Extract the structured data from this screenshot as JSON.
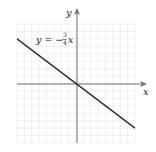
{
  "chart_data": {
    "type": "line",
    "title": "",
    "xlabel": "x",
    "ylabel": "y",
    "equation_label": "y = −¾x",
    "equation": {
      "slope": -0.75,
      "intercept": 0
    },
    "series": [
      {
        "name": "y = -3/4 x",
        "x": [
          -8,
          8
        ],
        "y": [
          6,
          -6
        ]
      }
    ],
    "xlim": [
      -8,
      8
    ],
    "ylim": [
      -8,
      8
    ],
    "grid": true,
    "legend": "none",
    "colors": {
      "line": "#2b2b2b",
      "axis": "#6e6e6e",
      "grid": "#e6e6e6"
    }
  },
  "labels": {
    "x_axis": "x",
    "y_axis": "y",
    "eq_lhs": "y = −",
    "eq_num": "3",
    "eq_den": "4",
    "eq_var": "x"
  }
}
